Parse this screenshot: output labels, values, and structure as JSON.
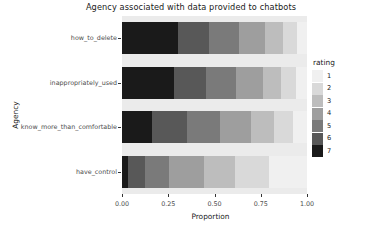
{
  "chart_data": {
    "type": "bar",
    "orientation": "horizontal",
    "stacked": true,
    "stack_mode": "fill",
    "title": "Agency associated with data provided to chatbots",
    "xlabel": "Proportion",
    "ylabel": "Agency",
    "legend_title": "rating",
    "legend_position": "right",
    "grid": false,
    "xlim": [
      0,
      1
    ],
    "xticks": [
      0.0,
      0.25,
      0.5,
      0.75,
      1.0
    ],
    "xticklabels": [
      "0.00",
      "0.25",
      "0.50",
      "0.75",
      "1.00"
    ],
    "categories": [
      "how_to_delete",
      "inappropriately_used",
      "know_more_than_comfortable",
      "have_control"
    ],
    "series": [
      {
        "name": "1",
        "color": "#f0f0f0",
        "values": [
          0.055,
          0.06,
          0.075,
          0.205
        ]
      },
      {
        "name": "2",
        "color": "#d9d9d9",
        "values": [
          0.075,
          0.08,
          0.105,
          0.185
        ]
      },
      {
        "name": "3",
        "color": "#bdbdbd",
        "values": [
          0.095,
          0.1,
          0.125,
          0.165
        ]
      },
      {
        "name": "4",
        "color": "#9e9e9e",
        "values": [
          0.14,
          0.145,
          0.165,
          0.19
        ]
      },
      {
        "name": "5",
        "color": "#7a7a7a",
        "values": [
          0.165,
          0.16,
          0.18,
          0.13
        ]
      },
      {
        "name": "6",
        "color": "#585858",
        "values": [
          0.165,
          0.175,
          0.19,
          0.095
        ]
      },
      {
        "name": "7",
        "color": "#1a1a1a",
        "values": [
          0.305,
          0.28,
          0.16,
          0.03
        ]
      }
    ],
    "panel_background": "#ebebeb",
    "axis_text_color": "#4d4d4d"
  },
  "legend": {
    "title": "rating",
    "items": [
      {
        "label": "1",
        "color": "#f0f0f0"
      },
      {
        "label": "2",
        "color": "#d9d9d9"
      },
      {
        "label": "3",
        "color": "#bdbdbd"
      },
      {
        "label": "4",
        "color": "#9e9e9e"
      },
      {
        "label": "5",
        "color": "#7a7a7a"
      },
      {
        "label": "6",
        "color": "#585858"
      },
      {
        "label": "7",
        "color": "#1a1a1a"
      }
    ]
  },
  "axes": {
    "x_title": "Proportion",
    "y_title": "Agency",
    "x_tick_labels": [
      "0.00",
      "0.25",
      "0.50",
      "0.75",
      "1.00"
    ],
    "y_tick_labels": [
      "how_to_delete",
      "inappropriately_used",
      "know_more_than_comfortable",
      "have_control"
    ]
  },
  "title": "Agency associated with data provided to chatbots"
}
